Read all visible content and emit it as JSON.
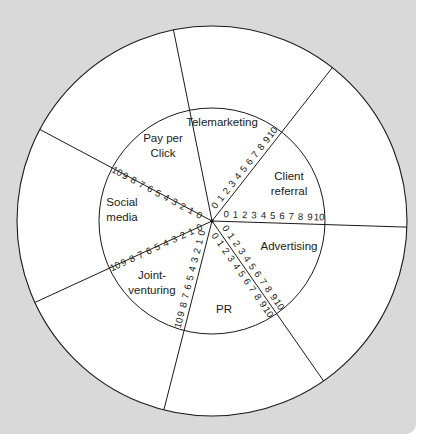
{
  "caption": {
    "text": ""
  },
  "diagram": {
    "type": "wheel",
    "center": [
      212,
      221
    ],
    "outer_radius": 195,
    "inner_radius": 113,
    "scale_range": [
      0,
      10
    ],
    "scale_ticks": [
      "0",
      "1",
      "2",
      "3",
      "4",
      "5",
      "6",
      "7",
      "8",
      "9",
      "10"
    ],
    "segments": [
      {
        "label_lines": [
          "Telemarketing"
        ],
        "label_pos": [
          222,
          126
        ]
      },
      {
        "label_lines": [
          "Client",
          "referral"
        ],
        "label_pos": [
          289,
          180
        ]
      },
      {
        "label_lines": [
          "Advertising"
        ],
        "label_pos": [
          289,
          250
        ]
      },
      {
        "label_lines": [
          "PR"
        ],
        "label_pos": [
          224,
          313
        ]
      },
      {
        "label_lines": [
          "Joint-",
          "venturing"
        ],
        "label_pos": [
          152,
          279
        ]
      },
      {
        "label_lines": [
          "Social",
          "media"
        ],
        "label_pos": [
          122,
          206
        ]
      },
      {
        "label_lines": [
          "Pay per",
          "Click"
        ],
        "label_pos": [
          163,
          142
        ]
      }
    ],
    "spoke_angles_deg": [
      -101.4,
      -51.9,
      1.8,
      55.1,
      104.3,
      155.3,
      208.0
    ]
  },
  "colors": {
    "panel": "#d9d9d9",
    "wheel_fill": "#ffffff",
    "line": "#1a1a1a"
  }
}
